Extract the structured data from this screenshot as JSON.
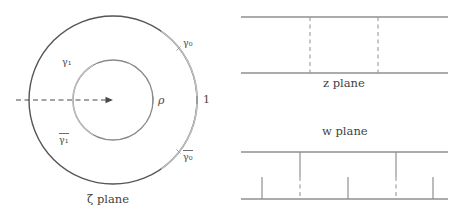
{
  "figure": {
    "background_color": "#ffffff",
    "dimensions": {
      "width": 462,
      "height": 214
    }
  },
  "colors": {
    "outer_circle_dark": "#555555",
    "arc_light_gray": "#b9b9b9",
    "inner_circle": "#8a8a8a",
    "strip_line": "#8f8f8f",
    "dashed_line": "#9a9a9a",
    "solid_vertical": "#8f8f8f",
    "axis_dashed": "#4a4a4a",
    "label_text": "#4a4a4a"
  },
  "zeta_panel": {
    "name": "zeta-plane",
    "caption": "ζ plane",
    "center": {
      "x": 113,
      "y": 100
    },
    "outer_radius": 84,
    "inner_radius": 40,
    "labels": {
      "gamma_0": "γ₀",
      "gamma_0_bar_base": "γ₀",
      "gamma_1": "γ₁",
      "gamma_1_bar_base": "γ₁",
      "rho": "ρ",
      "one": "1"
    },
    "tick_marks": [
      {
        "name": "rho-tick",
        "x": 153,
        "y": 100
      },
      {
        "name": "one-tick",
        "x": 197,
        "y": 100
      }
    ],
    "radial_arrow": {
      "name": "radial-axis-arrow",
      "from_x": 16,
      "to_x": 113,
      "y": 100,
      "style": "dashed-with-arrowhead"
    }
  },
  "z_panel": {
    "name": "z-plane",
    "caption": "z plane",
    "top_line_y": 17,
    "bottom_line_y": 73,
    "x_start": 241,
    "x_end": 448,
    "dashed_verticals": [
      {
        "name": "z-dashed-left",
        "x": 310
      },
      {
        "name": "z-dashed-right",
        "x": 378
      }
    ]
  },
  "w_panel": {
    "name": "w-plane",
    "caption": "w plane",
    "top_line_y": 152,
    "bottom_line_y": 199,
    "x_start": 241,
    "x_end": 448,
    "verticals": [
      {
        "name": "w-solid-top-left",
        "x": 300,
        "style": "solid",
        "from_y": 152,
        "to_y": 177
      },
      {
        "name": "w-dashed-left",
        "x": 300,
        "style": "dashed",
        "from_y": 177,
        "to_y": 199
      },
      {
        "name": "w-solid-top-right",
        "x": 396,
        "style": "solid",
        "from_y": 152,
        "to_y": 177
      },
      {
        "name": "w-dashed-right",
        "x": 396,
        "style": "dashed",
        "from_y": 177,
        "to_y": 199
      },
      {
        "name": "w-tick-far-left",
        "x": 262,
        "style": "solid",
        "from_y": 177,
        "to_y": 199
      },
      {
        "name": "w-tick-middle",
        "x": 348,
        "style": "solid",
        "from_y": 177,
        "to_y": 199
      },
      {
        "name": "w-tick-far-right",
        "x": 433,
        "style": "solid",
        "from_y": 177,
        "to_y": 199
      }
    ]
  }
}
